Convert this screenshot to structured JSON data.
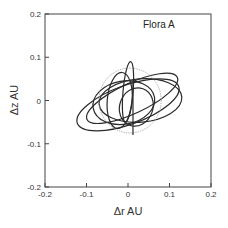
{
  "chart_data": {
    "type": "line",
    "title": "Flora A",
    "xlabel": "Δr  AU",
    "ylabel": "Δz  AU",
    "xlim": [
      -0.2,
      0.2
    ],
    "ylim": [
      -0.2,
      0.2
    ],
    "xticks": [
      "-0.2",
      "-0.1",
      "0",
      "0.1",
      "0.2"
    ],
    "yticks": [
      "0.2",
      "0.1",
      "0",
      "-0.1",
      "-0.2"
    ],
    "grid": false,
    "legend": "none",
    "series": [
      {
        "name": "ellipse-1",
        "cx": 0.0,
        "cy": -0.01,
        "rx": 0.13,
        "ry": 0.045,
        "rotation_deg": -20,
        "style": "solid"
      },
      {
        "name": "ellipse-2",
        "cx": 0.01,
        "cy": 0.005,
        "rx": 0.12,
        "ry": 0.035,
        "rotation_deg": -25,
        "style": "solid"
      },
      {
        "name": "ellipse-3",
        "cx": 0.03,
        "cy": 0.0,
        "rx": 0.1,
        "ry": 0.05,
        "rotation_deg": -5,
        "style": "solid"
      },
      {
        "name": "ellipse-4",
        "cx": -0.02,
        "cy": 0.0,
        "rx": 0.03,
        "ry": 0.065,
        "rotation_deg": 5,
        "style": "solid"
      },
      {
        "name": "ellipse-5",
        "cx": 0.0,
        "cy": 0.02,
        "rx": 0.012,
        "ry": 0.07,
        "rotation_deg": 5,
        "style": "solid"
      },
      {
        "name": "ellipse-6",
        "cx": 0.02,
        "cy": -0.015,
        "rx": 0.04,
        "ry": 0.045,
        "rotation_deg": 20,
        "style": "solid"
      },
      {
        "name": "ellipse-7",
        "cx": -0.01,
        "cy": -0.005,
        "rx": 0.075,
        "ry": 0.05,
        "rotation_deg": -10,
        "style": "solid"
      },
      {
        "name": "ellipse-8",
        "cx": 0.005,
        "cy": 0.0,
        "rx": 0.075,
        "ry": 0.075,
        "rotation_deg": 0,
        "style": "dotted"
      },
      {
        "name": "vertical-line",
        "x": 0.012,
        "y_from": 0.04,
        "y_to": -0.08,
        "style": "solid"
      }
    ]
  }
}
